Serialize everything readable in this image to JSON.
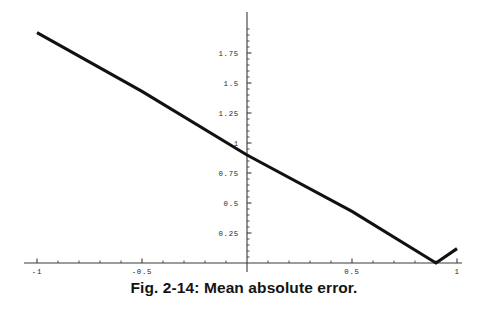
{
  "caption": "Fig. 2-14: Mean absolute error.",
  "chart_data": {
    "type": "line",
    "title": "",
    "subtitle": "",
    "xlabel": "",
    "ylabel": "",
    "xlim": [
      -1.08,
      1.02
    ],
    "ylim": [
      -0.04,
      1.97
    ],
    "grid": false,
    "legend": null,
    "x_ticks_labeled": [
      -1,
      -0.5,
      0.5,
      1
    ],
    "x_tick_labels": [
      "-1",
      "-0.5",
      "0.5",
      "1"
    ],
    "x_minor_tick_step": 0.1,
    "y_ticks_labeled": [
      0.25,
      0.5,
      0.75,
      1,
      1.25,
      1.5,
      1.75
    ],
    "y_tick_labels": [
      "0.25",
      "0.5",
      "0.75",
      "1",
      "1.25",
      "1.5",
      "1.75"
    ],
    "y_minor_tick_step": 0.05,
    "axes_cross_at": [
      0,
      0
    ],
    "series": [
      {
        "name": "mean absolute error",
        "points": [
          [
            -1,
            1.92
          ],
          [
            -0.5,
            1.43
          ],
          [
            0,
            0.9
          ],
          [
            0.5,
            0.43
          ],
          [
            0.9,
            0.0
          ],
          [
            1,
            0.12
          ]
        ],
        "color": "#111111",
        "width": 3.1
      }
    ],
    "annotations": [
      {
        "text": "minimum of curve",
        "x": 0.9,
        "y": 0.0
      }
    ],
    "axis_color": "#3a3a3a",
    "background": "#ffffff"
  },
  "axis": {
    "x_label_y_offset": 11,
    "y_label_x_offset": 8
  }
}
